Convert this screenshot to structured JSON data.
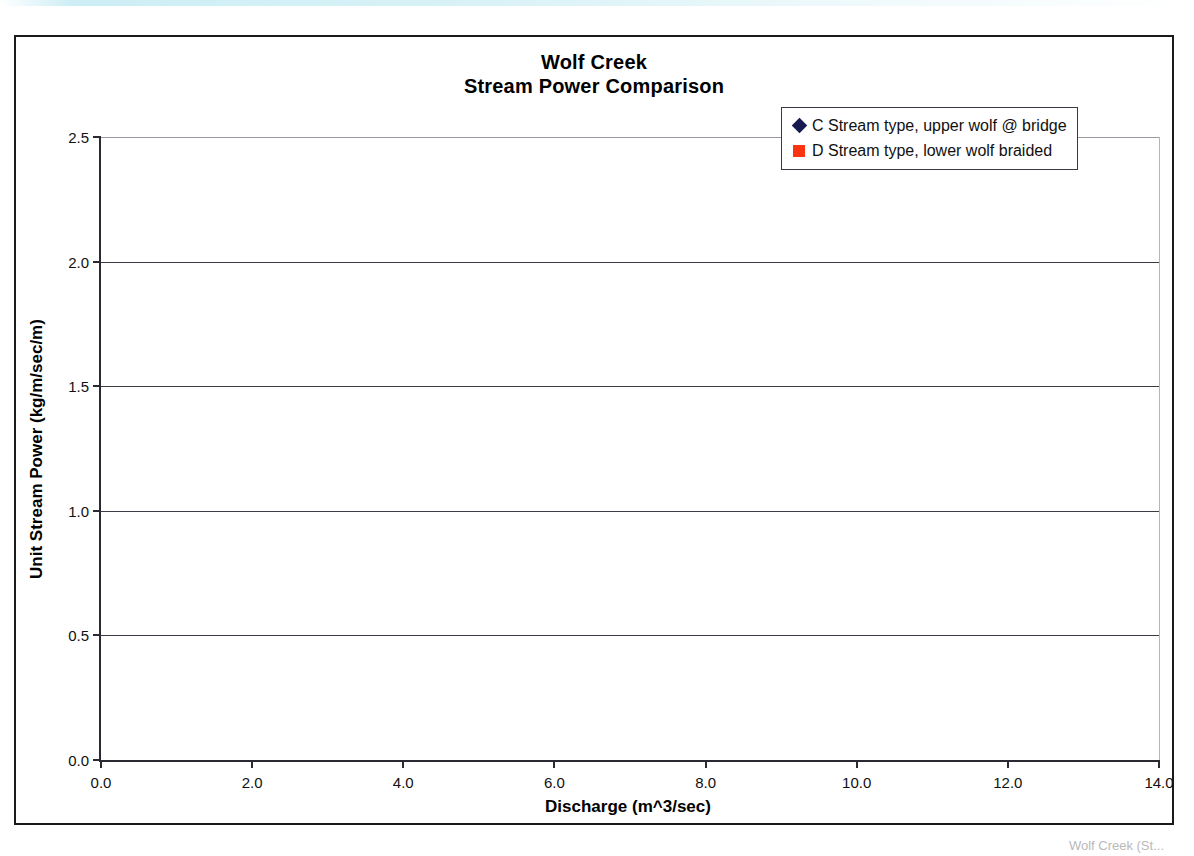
{
  "document": {
    "caption_fragment": "Wolf Creek (St..."
  },
  "chart": {
    "title_line1": "Wolf Creek",
    "title_line2": "Stream Power Comparison",
    "xlabel": "Discharge (m^3/sec)",
    "ylabel": "Unit Stream Power (kg/m/sec/m)",
    "xticks": [
      "0.0",
      "2.0",
      "4.0",
      "6.0",
      "8.0",
      "10.0",
      "12.0",
      "14.0"
    ],
    "yticks": [
      "0.0",
      "0.5",
      "1.0",
      "1.5",
      "2.0",
      "2.5"
    ],
    "legend": [
      {
        "label": "C Stream type, upper wolf @ bridge",
        "marker": "diamond-marker",
        "color": "#161a4e"
      },
      {
        "label": "D Stream type, lower wolf braided",
        "marker": "square-marker",
        "color": "#fa3411"
      }
    ]
  },
  "chart_data": {
    "type": "scatter",
    "xlabel": "Discharge (m^3/sec)",
    "ylabel": "Unit Stream Power (kg/m/sec/m)",
    "xlim": [
      0.0,
      14.0
    ],
    "ylim": [
      0.0,
      2.5
    ],
    "xticks": [
      0.0,
      2.0,
      4.0,
      6.0,
      8.0,
      10.0,
      12.0,
      14.0
    ],
    "yticks": [
      0.0,
      0.5,
      1.0,
      1.5,
      2.0,
      2.5
    ],
    "grid": "horizontal",
    "legend_position": "top-right",
    "series": [
      {
        "name": "C Stream type, upper wolf @ bridge",
        "marker": "diamond",
        "color": "#161a4e",
        "points": [
          [
            1.15,
            0.59
          ],
          [
            1.5,
            0.7
          ],
          [
            1.85,
            0.81
          ],
          [
            2.25,
            0.93
          ],
          [
            2.75,
            1.02
          ],
          [
            3.25,
            1.11
          ],
          [
            3.9,
            1.2
          ],
          [
            4.5,
            1.33
          ],
          [
            5.25,
            1.47
          ],
          [
            6.0,
            1.62
          ],
          [
            6.85,
            1.77
          ],
          [
            7.75,
            1.86
          ],
          [
            8.6,
            1.93
          ],
          [
            9.45,
            1.98
          ],
          [
            10.45,
            2.05
          ]
        ]
      },
      {
        "name": "D Stream type, lower wolf braided",
        "marker": "square",
        "color": "#fa3411",
        "points": [
          [
            0.6,
            0.08
          ],
          [
            0.95,
            0.11
          ],
          [
            1.45,
            0.15
          ],
          [
            1.85,
            0.17
          ],
          [
            2.25,
            0.18
          ],
          [
            2.8,
            0.21
          ],
          [
            3.2,
            0.17
          ],
          [
            3.95,
            0.21
          ],
          [
            4.8,
            0.24
          ],
          [
            5.75,
            0.28
          ],
          [
            6.8,
            0.31
          ],
          [
            7.8,
            0.35
          ],
          [
            9.0,
            0.38
          ],
          [
            10.25,
            0.41
          ],
          [
            11.0,
            0.36
          ],
          [
            12.3,
            0.38
          ]
        ]
      }
    ]
  }
}
